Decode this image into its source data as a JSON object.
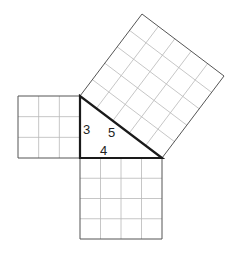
{
  "diagram": {
    "triangle": {
      "right_angle": [
        80,
        158
      ],
      "top": [
        80,
        96
      ],
      "right": [
        162,
        158
      ]
    },
    "labels": {
      "side_a": "3",
      "side_b": "4",
      "side_c": "5"
    },
    "squares": [
      {
        "name": "square-a",
        "side": 3,
        "cells": 9
      },
      {
        "name": "square-b",
        "side": 4,
        "cells": 16
      },
      {
        "name": "square-c",
        "side": 5,
        "cells": 25
      }
    ],
    "colors": {
      "grid": "#b8b8b8",
      "outline": "#555555",
      "triangle": "#1a1a1a"
    }
  }
}
